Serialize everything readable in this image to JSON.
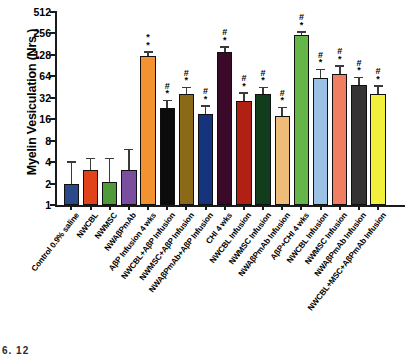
{
  "chart_data": {
    "type": "bar",
    "title": "",
    "xlabel": "",
    "ylabel": "Myelin Vesiculation (Nrs.)",
    "yscale": "log2",
    "ylim": [
      1,
      512
    ],
    "yticks": [
      1,
      2,
      4,
      8,
      16,
      32,
      64,
      128,
      256,
      512
    ],
    "ytick_labels": [
      "1",
      "2",
      "4",
      "8",
      "16",
      "32",
      "64",
      "128",
      "256",
      "512"
    ],
    "grid": false,
    "legend": false,
    "categories": [
      "Control 0.9% saline",
      "NWCBL",
      "NWMSC",
      "NWAβPmAb",
      "AβP Infusion 4 wks",
      "NWCBL+AβP Infusion",
      "NWMSC+AβP Infusion",
      "NWAβPmAb+AβP Infusion",
      "CHI 4 wks",
      "NWCBL Infusion",
      "NWMSC Infusion",
      "NWAβPmAb Infusion",
      "AβP+CHI 4 wks",
      "NWCBL Infusion",
      "NWMSC Infusion",
      "NWAβPmAb Infusion",
      "NWCBL+MSC+AβPmAb Infusion"
    ],
    "values": [
      2.0,
      3.1,
      2.1,
      3.1,
      124,
      23,
      36,
      19,
      140,
      29,
      36,
      18,
      240,
      60,
      70,
      48,
      36
    ],
    "errors_upper": [
      4.1,
      4.6,
      4.6,
      6.2,
      144,
      30,
      46,
      25,
      170,
      38,
      46,
      24,
      275,
      82,
      92,
      63,
      48
    ],
    "bar_colors": [
      "#2c4a8a",
      "#e0431a",
      "#4f9b3c",
      "#7b4fa0",
      "#f29230",
      "#0c0c0c",
      "#8a6a18",
      "#16337e",
      "#3b0a28",
      "#b02113",
      "#123d1c",
      "#eebb78",
      "#66b549",
      "#9bc2e4",
      "#f07e62",
      "#343434",
      "#f2f03a"
    ],
    "significance": [
      "",
      "",
      "",
      "",
      "*\n*",
      "#\n*",
      "#\n*",
      "#\n*",
      "#\n*",
      "#\n*",
      "#\n*",
      "#\n*",
      "#\n*",
      "#\n*",
      "#\n*",
      "#\n*",
      "#\n*"
    ],
    "bar_count": 17,
    "n_extra_bar": 1
  },
  "figure": {
    "footer_fragment": "6, 12"
  }
}
